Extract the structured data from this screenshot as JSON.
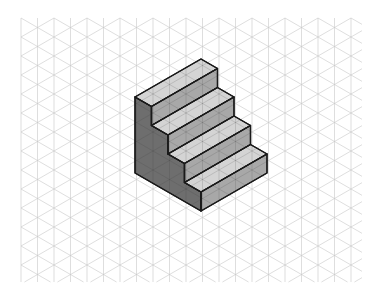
{
  "figure": {
    "grid": {
      "type": "isometric",
      "x_start": 21,
      "y_start": 18,
      "x_end": 362,
      "y_end": 282,
      "horizontal_spacing": 16.5,
      "vertical_spacing": 19,
      "line_color": "#c8c8c8"
    },
    "staircase": {
      "steps": 4,
      "origin": [
        135,
        97
      ],
      "unit_right_down": [
        16.5,
        9.5
      ],
      "unit_right_up": [
        16.5,
        -9.5
      ],
      "unit_vertical": 19,
      "length_units": 4,
      "colors": {
        "tread": "#d4d4d4",
        "riser": "#a8a8a8",
        "side": "#6e6e6e",
        "edge": "#1a1a1a"
      }
    }
  }
}
